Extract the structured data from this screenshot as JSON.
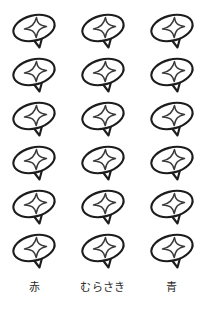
{
  "page": {
    "background_color": "#ffffff",
    "ink_color": "#1c1c1c",
    "accent_color": "#3a3a3a",
    "width": 206,
    "height": 311
  },
  "icon": {
    "name": "spinning-top-star-icon",
    "description": "tilted ellipse with four-pointed star and cone tail",
    "outline_color": "#1c1c1c",
    "star_color": "#3a3a3a",
    "fill_color": "#ffffff"
  },
  "grid": {
    "columns": 3,
    "rows": 6,
    "total_items": 18
  },
  "columns": [
    {
      "id": "col-red",
      "label": "赤",
      "index": 1,
      "count": 6
    },
    {
      "id": "col-purple",
      "label": "むらさき",
      "index": 2,
      "count": 6
    },
    {
      "id": "col-blue",
      "label": "青",
      "index": 3,
      "count": 6
    }
  ],
  "items": [
    {
      "row": 1,
      "column": 1
    },
    {
      "row": 1,
      "column": 2
    },
    {
      "row": 1,
      "column": 3
    },
    {
      "row": 2,
      "column": 1
    },
    {
      "row": 2,
      "column": 2
    },
    {
      "row": 2,
      "column": 3
    },
    {
      "row": 3,
      "column": 1
    },
    {
      "row": 3,
      "column": 2
    },
    {
      "row": 3,
      "column": 3
    },
    {
      "row": 4,
      "column": 1
    },
    {
      "row": 4,
      "column": 2
    },
    {
      "row": 4,
      "column": 3
    },
    {
      "row": 5,
      "column": 1
    },
    {
      "row": 5,
      "column": 2
    },
    {
      "row": 5,
      "column": 3
    },
    {
      "row": 6,
      "column": 1
    },
    {
      "row": 6,
      "column": 2
    },
    {
      "row": 6,
      "column": 3
    }
  ]
}
